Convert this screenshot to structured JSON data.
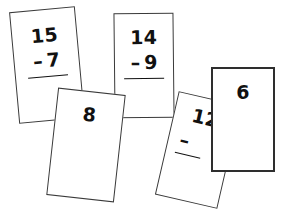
{
  "scene": {
    "title": "Subtraction flash cards",
    "background_color": "#ffffff",
    "ink_color": "#111111",
    "card_fill": "#ffffff",
    "card_border_color": "#3a3a3a",
    "width": 286,
    "height": 215
  },
  "cards": [
    {
      "id": "card-15",
      "kind": "subtraction-problem",
      "minuend": "15",
      "operator": "–",
      "subtrahend": "7",
      "has_rule": true,
      "answer": "",
      "rotation_deg": -5.2
    },
    {
      "id": "card-14",
      "kind": "subtraction-problem",
      "minuend": "14",
      "operator": "–",
      "subtrahend": "9",
      "has_rule": true,
      "answer": "",
      "rotation_deg": -0.6
    },
    {
      "id": "card-12",
      "kind": "subtraction-problem-partial",
      "minuend": "12",
      "operator": "–",
      "subtrahend": "",
      "has_rule": true,
      "answer": "",
      "rotation_deg": 13
    },
    {
      "id": "card-8",
      "kind": "answer",
      "minuend": "",
      "operator": "",
      "subtrahend": "",
      "has_rule": false,
      "answer": "8",
      "rotation_deg": 6.3
    },
    {
      "id": "card-6",
      "kind": "answer",
      "minuend": "",
      "operator": "",
      "subtrahend": "",
      "has_rule": false,
      "answer": "6",
      "rotation_deg": 0
    }
  ]
}
